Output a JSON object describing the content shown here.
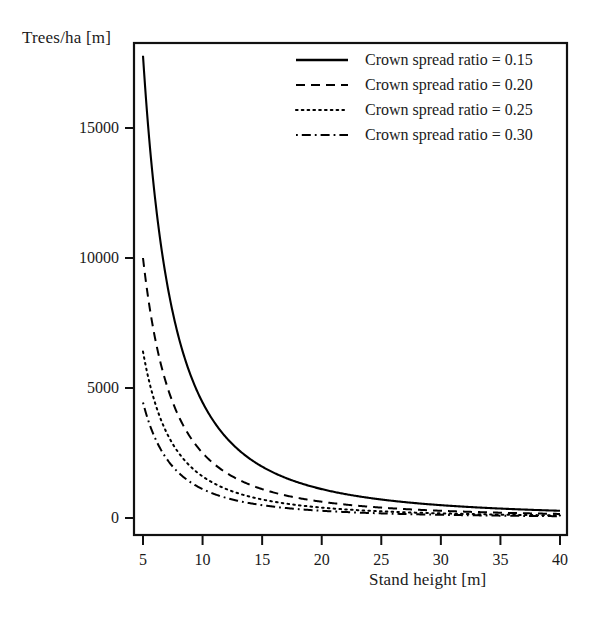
{
  "chart_data": {
    "type": "line",
    "title": "",
    "xlabel": "Stand height [m]",
    "ylabel": "Trees/ha [m]",
    "xlim": [
      5,
      40
    ],
    "ylim": [
      0,
      18500
    ],
    "xticks": [
      5,
      10,
      15,
      20,
      25,
      30,
      35,
      40
    ],
    "xtick_labels": [
      "5",
      "10",
      "15",
      "20",
      "25",
      "30",
      "35",
      "40"
    ],
    "yticks": [
      0,
      5000,
      10000,
      15000
    ],
    "ytick_labels": [
      "0",
      "5000",
      "10000",
      "15000"
    ],
    "grid": false,
    "legend_position": "top-right",
    "frame": "box",
    "series": [
      {
        "name": "Crown spread ratio = 0.15",
        "crown_spread_ratio": 0.15,
        "linestyle": "solid",
        "color": "#000000",
        "x": [
          5,
          6,
          7,
          8,
          9,
          10,
          11,
          12,
          13,
          14,
          15,
          16,
          17,
          18,
          19,
          20,
          22,
          24,
          26,
          28,
          30,
          32,
          34,
          36,
          38,
          40
        ],
        "values": [
          17778,
          12346,
          9070,
          6944,
          5487,
          4444,
          3673,
          3086,
          2630,
          2268,
          1975,
          1736,
          1537,
          1372,
          1231,
          1111,
          918,
          772,
          657,
          567,
          494,
          434,
          384,
          343,
          308,
          278
        ]
      },
      {
        "name": "Crown spread ratio = 0.20",
        "crown_spread_ratio": 0.2,
        "linestyle": "dashed",
        "color": "#000000",
        "x": [
          5,
          6,
          7,
          8,
          9,
          10,
          11,
          12,
          13,
          14,
          15,
          16,
          17,
          18,
          19,
          20,
          22,
          24,
          26,
          28,
          30,
          32,
          34,
          36,
          38,
          40
        ],
        "values": [
          10000,
          6944,
          5102,
          3906,
          3086,
          2500,
          2066,
          1736,
          1479,
          1276,
          1111,
          977,
          865,
          772,
          693,
          625,
          517,
          434,
          370,
          319,
          278,
          244,
          216,
          193,
          173,
          156
        ]
      },
      {
        "name": "Crown spread ratio = 0.25",
        "crown_spread_ratio": 0.25,
        "linestyle": "dotted",
        "color": "#000000",
        "x": [
          5,
          6,
          7,
          8,
          9,
          10,
          11,
          12,
          13,
          14,
          15,
          16,
          17,
          18,
          19,
          20,
          22,
          24,
          26,
          28,
          30,
          32,
          34,
          36,
          38,
          40
        ],
        "values": [
          6400,
          4444,
          3265,
          2500,
          1975,
          1600,
          1322,
          1111,
          947,
          816,
          711,
          625,
          554,
          494,
          443,
          400,
          331,
          278,
          237,
          204,
          178,
          156,
          138,
          123,
          111,
          100
        ]
      },
      {
        "name": "Crown spread ratio = 0.30",
        "crown_spread_ratio": 0.3,
        "linestyle": "dashdot",
        "color": "#000000",
        "x": [
          5,
          6,
          7,
          8,
          9,
          10,
          11,
          12,
          13,
          14,
          15,
          16,
          17,
          18,
          19,
          20,
          22,
          24,
          26,
          28,
          30,
          32,
          34,
          36,
          38,
          40
        ],
        "values": [
          4444,
          3086,
          2268,
          1736,
          1372,
          1111,
          918,
          772,
          657,
          567,
          494,
          434,
          384,
          343,
          308,
          278,
          230,
          193,
          164,
          142,
          123,
          109,
          96,
          86,
          77,
          69
        ]
      }
    ],
    "legend": [
      {
        "label": "Crown spread ratio = 0.15",
        "linestyle": "solid"
      },
      {
        "label": "Crown spread ratio = 0.20",
        "linestyle": "dashed"
      },
      {
        "label": "Crown spread ratio = 0.25",
        "linestyle": "dotted"
      },
      {
        "label": "Crown spread ratio = 0.30",
        "linestyle": "dashdot"
      }
    ]
  }
}
